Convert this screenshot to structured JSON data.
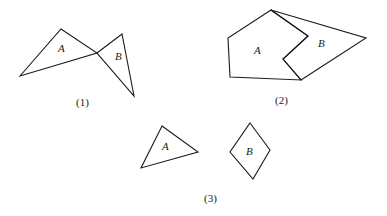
{
  "figures": [
    {
      "caption": "(1)",
      "regions": [
        {
          "label": "A",
          "points": "20,76 61,29 97,53"
        },
        {
          "label": "B",
          "points": "97,53 122,34 134,96"
        }
      ]
    },
    {
      "caption": "(2)",
      "regions": [
        {
          "label": "A",
          "points": "271,10 228,38 230,77 301,80 283,59 308,36"
        },
        {
          "label": "B",
          "points": "271,10 366,38 301,80 283,59 308,36"
        }
      ]
    },
    {
      "caption": "(3)",
      "regions": [
        {
          "label": "A",
          "points": "162,126 198,152 141,168"
        },
        {
          "label": "B",
          "points": "250,123 270,150 253,179 230,152"
        }
      ]
    }
  ],
  "stroke_color": "#1a1a1a"
}
